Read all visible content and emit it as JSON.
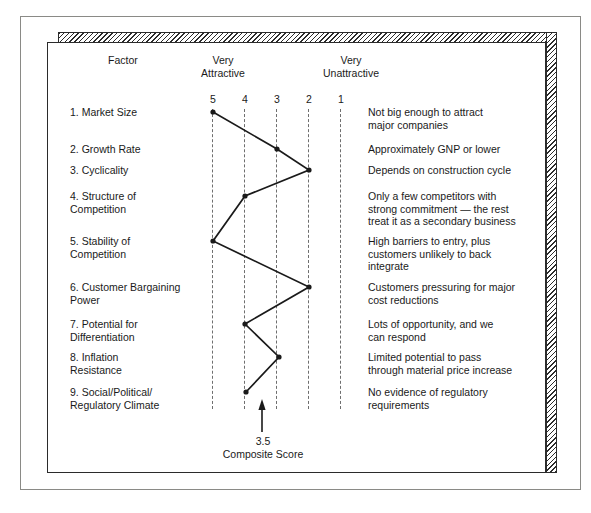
{
  "header": {
    "factor_col": "Factor",
    "very_attractive": "Very\nAttractive",
    "very_unattractive": "Very\nUnattractive"
  },
  "scale": {
    "ticks": [
      "5",
      "4",
      "3",
      "2",
      "1"
    ]
  },
  "composite": {
    "value": "3.5",
    "caption": "Composite Score"
  },
  "rows": [
    {
      "factor": "1. Market Size",
      "comment": "Not big enough to attract\nmajor companies"
    },
    {
      "factor": "2. Growth Rate",
      "comment": "Approximately GNP or lower"
    },
    {
      "factor": "3. Cyclicality",
      "comment": "Depends on construction cycle"
    },
    {
      "factor": "4. Structure of\n    Competition",
      "comment": "Only a few competitors with\nstrong commitment — the rest\ntreat it as a secondary business"
    },
    {
      "factor": "5. Stability of\n    Competition",
      "comment": "High barriers to entry, plus\ncustomers unlikely to back\nintegrate"
    },
    {
      "factor": "6. Customer Bargaining\n    Power",
      "comment": "Customers pressuring for major\ncost reductions"
    },
    {
      "factor": "7. Potential for\n    Differentiation",
      "comment": "Lots of opportunity, and we\ncan respond"
    },
    {
      "factor": "8. Inflation\n    Resistance",
      "comment": "Limited potential to pass\nthrough material price increase"
    },
    {
      "factor": "9. Social/Political/\n    Regulatory Climate",
      "comment": "No evidence of regulatory\nrequirements"
    }
  ],
  "chart_data": {
    "type": "line",
    "xlabel": "",
    "ylabel": "",
    "xlim": [
      5,
      1
    ],
    "x_ticks": [
      5,
      4,
      3,
      2,
      1
    ],
    "x_tick_labels": [
      "5",
      "4",
      "3",
      "2",
      "1"
    ],
    "x_axis_left_label": "Very Attractive",
    "x_axis_right_label": "Very Unattractive",
    "grid": true,
    "grid_style": "dashed-vertical",
    "legend": false,
    "categories": [
      "1. Market Size",
      "2. Growth Rate",
      "3. Cyclicality",
      "4. Structure of Competition",
      "5. Stability of Competition",
      "6. Customer Bargaining Power",
      "7. Potential for Differentiation",
      "8. Inflation Resistance",
      "9. Social/Political/Regulatory Climate"
    ],
    "values": [
      5,
      3,
      2,
      4,
      5,
      2,
      4,
      2.9,
      4
    ],
    "annotations": [
      {
        "text": "3.5",
        "label": "Composite Score",
        "x": 3.5,
        "type": "arrow-up"
      }
    ]
  },
  "geometry": {
    "tick_x": [
      165,
      197,
      229,
      261,
      293
    ],
    "row_y": [
      69,
      106,
      127,
      153,
      198,
      244,
      281,
      314,
      349
    ],
    "point_y": [
      69,
      106,
      127,
      153,
      198,
      244,
      281,
      314,
      349
    ],
    "point_x": [
      165,
      229,
      261,
      197,
      165,
      261,
      197,
      231,
      198
    ],
    "grid_top": 66,
    "grid_bottom": 366,
    "arrow_x": 214,
    "arrow_tip_y": 356,
    "arrow_tail_y": 389
  },
  "colors": {
    "ink": "#1a1a1a",
    "grid": "#6e6e6e",
    "frame": "#8a8a86",
    "panel_border": "#2b2b2b",
    "background": "#ffffff"
  }
}
